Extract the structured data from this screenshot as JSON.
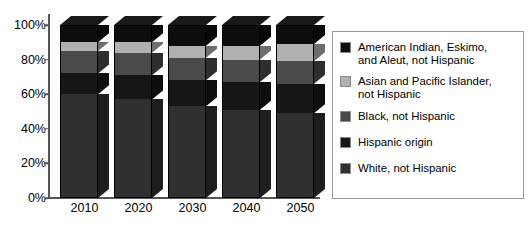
{
  "chart_data": {
    "type": "bar",
    "subtype": "stacked-bar-3d",
    "title": "",
    "subtitle": "",
    "xlabel": "",
    "ylabel": "",
    "categories": [
      "2010",
      "2020",
      "2030",
      "2040",
      "2050"
    ],
    "ylim": [
      0,
      100
    ],
    "yticks": [
      "0%",
      "20%",
      "40%",
      "60%",
      "80%",
      "100%"
    ],
    "ytick_values": [
      0,
      20,
      40,
      60,
      80,
      100
    ],
    "grid": false,
    "legend_position": "right",
    "stack_order_bottom_to_top": [
      "White, not Hispanic",
      "Hispanic origin",
      "Black, not Hispanic",
      "Asian and Pacific Islander, not Hispanic",
      "American Indian, Eskimo, and Aleut, not Hispanic"
    ],
    "series": [
      {
        "name": "White, not Hispanic",
        "color": "#303030",
        "values": [
          60,
          57,
          53,
          51,
          49
        ]
      },
      {
        "name": "Hispanic origin",
        "color": "#161616",
        "values": [
          12,
          14,
          15,
          16,
          17
        ]
      },
      {
        "name": "Black, not Hispanic",
        "color": "#4a4a4a",
        "values": [
          13,
          13,
          13,
          13,
          13
        ]
      },
      {
        "name": "Asian and Pacific Islander, not Hispanic",
        "color": "#b0b0b0",
        "values": [
          5,
          6,
          7,
          8,
          10
        ]
      },
      {
        "name": "American Indian, Eskimo, and Aleut, not Hispanic",
        "color": "#0d0d0d",
        "values": [
          10,
          10,
          12,
          12,
          11
        ]
      }
    ]
  },
  "axes": {
    "y_ticks": [
      {
        "label": "100%",
        "value": 100
      },
      {
        "label": "80%",
        "value": 80
      },
      {
        "label": "60%",
        "value": 60
      },
      {
        "label": "40%",
        "value": 40
      },
      {
        "label": "20%",
        "value": 20
      },
      {
        "label": "0%",
        "value": 0
      }
    ],
    "x_ticks": [
      {
        "label": "2010"
      },
      {
        "label": "2020"
      },
      {
        "label": "2030"
      },
      {
        "label": "2040"
      },
      {
        "label": "2050"
      }
    ]
  },
  "legend": {
    "items": [
      {
        "label": "American Indian, Eskimo,\nand Aleut, not Hispanic",
        "swatch_name": "legend-swatch-american-indian",
        "color": "#0d0d0d"
      },
      {
        "label": "Asian and Pacific Islander,\nnot Hispanic",
        "swatch_name": "legend-swatch-asian-pacific-islander",
        "color": "#b0b0b0"
      },
      {
        "label": "Black, not Hispanic",
        "swatch_name": "legend-swatch-black",
        "color": "#4a4a4a"
      },
      {
        "label": "Hispanic origin",
        "swatch_name": "legend-swatch-hispanic",
        "color": "#161616"
      },
      {
        "label": "White, not Hispanic",
        "swatch_name": "legend-swatch-white",
        "color": "#303030"
      }
    ]
  },
  "colors": {
    "axis": "#555555",
    "background": "#ffffff",
    "legend_border": "#9a9a9a",
    "text": "#000000"
  }
}
